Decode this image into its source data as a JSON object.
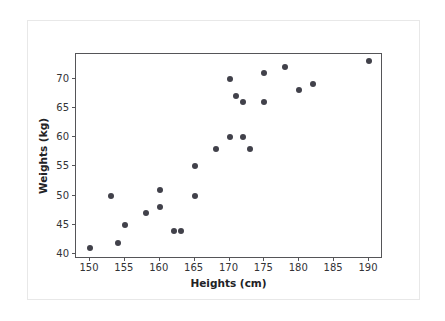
{
  "chart_data": {
    "type": "scatter",
    "title": "",
    "xlabel": "Heights (cm)",
    "ylabel": "Weights (kg)",
    "xlim": [
      148,
      192
    ],
    "ylim": [
      39.2,
      74.2
    ],
    "xticks": [
      150,
      155,
      160,
      165,
      170,
      175,
      180,
      185,
      190
    ],
    "xticklabels": [
      "150",
      "155",
      "160",
      "165",
      "170",
      "175",
      "180",
      "185",
      "190"
    ],
    "yticks": [
      40,
      45,
      50,
      55,
      60,
      65,
      70
    ],
    "yticklabels": [
      "40",
      "45",
      "50",
      "55",
      "60",
      "65",
      "70"
    ],
    "grid": false,
    "legend": null,
    "marker_color": "#41414a",
    "marker_size": 6,
    "axes_color": "#555558",
    "background": "#ffffff",
    "x": [
      150,
      153,
      154,
      155,
      158,
      160,
      160,
      162,
      163,
      165,
      165,
      168,
      170,
      170,
      171,
      172,
      172,
      173,
      175,
      175,
      178,
      180,
      182,
      190
    ],
    "y": [
      41,
      50,
      42,
      45,
      47,
      48,
      51,
      44,
      44,
      50,
      55,
      58,
      60,
      70,
      67,
      60,
      66,
      58,
      66,
      71,
      72,
      68,
      69,
      73
    ],
    "points": [
      {
        "x": 150,
        "y": 41
      },
      {
        "x": 153,
        "y": 50
      },
      {
        "x": 154,
        "y": 42
      },
      {
        "x": 155,
        "y": 45
      },
      {
        "x": 158,
        "y": 47
      },
      {
        "x": 160,
        "y": 48
      },
      {
        "x": 160,
        "y": 51
      },
      {
        "x": 162,
        "y": 44
      },
      {
        "x": 163,
        "y": 44
      },
      {
        "x": 165,
        "y": 50
      },
      {
        "x": 165,
        "y": 55
      },
      {
        "x": 168,
        "y": 58
      },
      {
        "x": 170,
        "y": 60
      },
      {
        "x": 170,
        "y": 70
      },
      {
        "x": 171,
        "y": 67
      },
      {
        "x": 172,
        "y": 60
      },
      {
        "x": 172,
        "y": 66
      },
      {
        "x": 173,
        "y": 58
      },
      {
        "x": 175,
        "y": 66
      },
      {
        "x": 175,
        "y": 71
      },
      {
        "x": 178,
        "y": 72
      },
      {
        "x": 180,
        "y": 68
      },
      {
        "x": 182,
        "y": 69
      },
      {
        "x": 190,
        "y": 73
      }
    ]
  }
}
